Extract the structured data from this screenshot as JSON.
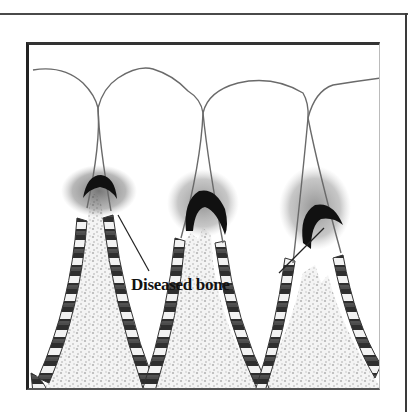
{
  "figure": {
    "type": "dental-illustration",
    "teeth_count": 4,
    "label": "Diseased bone",
    "leader_lines": 2,
    "colors": {
      "outline": "#555555",
      "calculus": "#111111",
      "plaque_shading": "#444444",
      "bone_stipple": "#bdbdbd",
      "ligament_stripes": "#2a2a2a",
      "background": "#ffffff"
    }
  }
}
